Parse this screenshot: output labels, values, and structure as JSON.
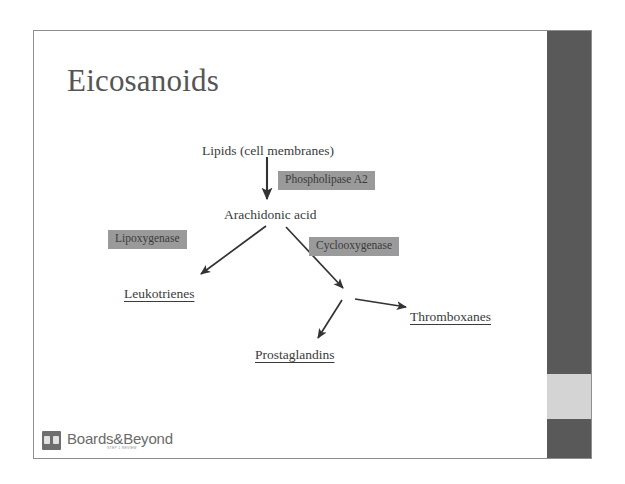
{
  "slide": {
    "title": "Eicosanoids",
    "background_color": "#ffffff",
    "border_color": "#8e8e8e",
    "title_color": "#555555"
  },
  "right_bar": {
    "color": "#595959",
    "accent_color": "#d4d4d4",
    "accent_top_px": 343,
    "accent_height_px": 45
  },
  "diagram": {
    "type": "flowchart",
    "substrates": [
      {
        "label": "Lipids (cell membranes)",
        "x": 168,
        "y": 113
      },
      {
        "label": "Arachidonic acid",
        "x": 190,
        "y": 177
      }
    ],
    "enzymes": [
      {
        "label": "Phospholipase A2",
        "x": 244,
        "y": 140
      },
      {
        "label": "Lipoxygenase",
        "x": 74,
        "y": 199
      },
      {
        "label": "Cyclooxygenase",
        "x": 275,
        "y": 206
      }
    ],
    "products": [
      {
        "label": "Leukotrienes",
        "x": 90,
        "y": 256
      },
      {
        "label": "Thromboxanes",
        "x": 376,
        "y": 279
      },
      {
        "label": "Prostaglandins",
        "x": 221,
        "y": 317
      }
    ],
    "enzyme_box_color": "#9a9a9a",
    "text_color": "#3b3b3b",
    "arrow_color": "#333333"
  },
  "logo": {
    "name": "Boards&Beyond",
    "tagline": "STEP 1 REVIEW",
    "mark": "boards-and-beyond-mark"
  }
}
